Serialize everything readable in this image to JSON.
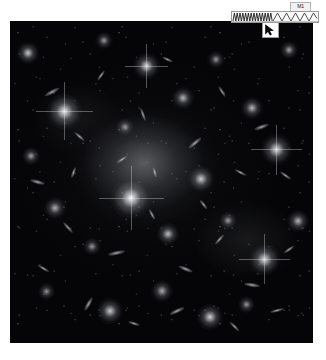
{
  "page": {
    "background_color": "#ffffff",
    "width": 326,
    "height": 360
  },
  "plate": {
    "name": "galaxy-cluster-deep-field",
    "background_color": "#050507",
    "left": 10,
    "top": 21,
    "width": 303,
    "height": 322,
    "caption": ""
  },
  "overlay": {
    "label": {
      "text": "M1",
      "background_color": "#f2f2f2",
      "text_color": "#1a1a1a"
    },
    "waveform": {
      "background_color": "#fbfbfb",
      "stroke_color": "#1c1c1c",
      "left_segment": "dense-zigzag",
      "right_segment": "triangle-wave"
    },
    "cursor": {
      "glyph": "arrow-pointer",
      "color": "#0a0a0a",
      "background_color": "#fdfdfd"
    }
  },
  "objects": {
    "galaxies": [
      {
        "x": 6,
        "y": 10,
        "r": 5,
        "b": 0.78
      },
      {
        "x": 18,
        "y": 28,
        "r": 8,
        "b": 0.92
      },
      {
        "x": 7,
        "y": 42,
        "r": 4,
        "b": 0.62
      },
      {
        "x": 31,
        "y": 6,
        "r": 4,
        "b": 0.6
      },
      {
        "x": 45,
        "y": 14,
        "r": 6,
        "b": 0.85
      },
      {
        "x": 38,
        "y": 33,
        "r": 4,
        "b": 0.55
      },
      {
        "x": 57,
        "y": 24,
        "r": 5,
        "b": 0.7
      },
      {
        "x": 68,
        "y": 12,
        "r": 4,
        "b": 0.58
      },
      {
        "x": 80,
        "y": 27,
        "r": 5,
        "b": 0.72
      },
      {
        "x": 92,
        "y": 9,
        "r": 4,
        "b": 0.64
      },
      {
        "x": 88,
        "y": 40,
        "r": 7,
        "b": 0.88
      },
      {
        "x": 15,
        "y": 58,
        "r": 5,
        "b": 0.68
      },
      {
        "x": 27,
        "y": 70,
        "r": 4,
        "b": 0.58
      },
      {
        "x": 40,
        "y": 55,
        "r": 9,
        "b": 0.98
      },
      {
        "x": 52,
        "y": 66,
        "r": 5,
        "b": 0.74
      },
      {
        "x": 63,
        "y": 49,
        "r": 6,
        "b": 0.8
      },
      {
        "x": 72,
        "y": 62,
        "r": 4,
        "b": 0.6
      },
      {
        "x": 84,
        "y": 74,
        "r": 7,
        "b": 0.86
      },
      {
        "x": 95,
        "y": 62,
        "r": 5,
        "b": 0.7
      },
      {
        "x": 12,
        "y": 84,
        "r": 4,
        "b": 0.56
      },
      {
        "x": 33,
        "y": 90,
        "r": 6,
        "b": 0.78
      },
      {
        "x": 50,
        "y": 84,
        "r": 5,
        "b": 0.66
      },
      {
        "x": 66,
        "y": 92,
        "r": 6,
        "b": 0.82
      },
      {
        "x": 78,
        "y": 88,
        "r": 4,
        "b": 0.58
      }
    ]
  }
}
